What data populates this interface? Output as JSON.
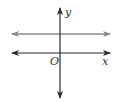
{
  "diagram": {
    "type": "coordinate-plane",
    "axes": {
      "x_label": "x",
      "y_label": "y",
      "origin_label": "O",
      "color": "#2a2a2a"
    },
    "lines": [
      {
        "name": "horizontal-line-above-x-axis",
        "orientation": "horizontal",
        "position": "above x-axis",
        "color": "#8a8a8a",
        "arrows": "both ends"
      }
    ]
  }
}
